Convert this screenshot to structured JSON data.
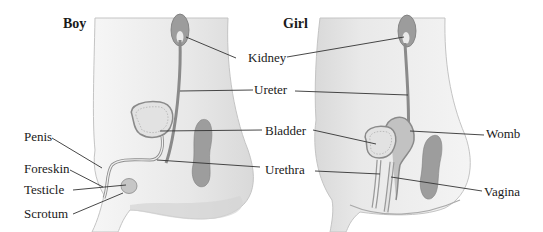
{
  "diagram": {
    "panels": [
      {
        "id": "boy",
        "title": "Boy"
      },
      {
        "id": "girl",
        "title": "Girl"
      }
    ],
    "labels": {
      "kidney": "Kidney",
      "ureter": "Ureter",
      "bladder": "Bladder",
      "urethra": "Urethra",
      "penis": "Penis",
      "foreskin": "Foreskin",
      "testicle": "Testicle",
      "scrotum": "Scrotum",
      "womb": "Womb",
      "vagina": "Vagina"
    },
    "colors": {
      "body_fill": "#ececec",
      "body_outline": "#bdbdbd",
      "organ_fill": "#9a9a9a",
      "organ_light": "#d6d6d6",
      "leader_line": "#333333",
      "text": "#1a1a1a"
    }
  }
}
